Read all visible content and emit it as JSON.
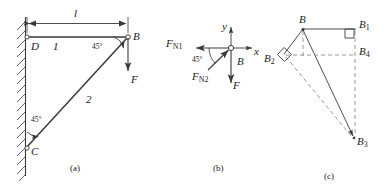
{
  "figure": {
    "type": "engineering-statics-diagram",
    "panels": [
      {
        "id": "a",
        "caption": "(a)",
        "description": "Two-bar bracket attached to a wall: horizontal bar 1 from D to B, inclined bar 2 from C to B, load F applied downward at B",
        "labels": {
          "dimension": "l",
          "node_d": "D",
          "node_c": "C",
          "node_b": "B",
          "bar1": "1",
          "bar2": "2",
          "angle_at_b": "45°",
          "angle_at_c": "45°",
          "load": "F"
        }
      },
      {
        "id": "b",
        "caption": "(b)",
        "description": "Free-body diagram of joint B with x-y axes, bar forces F_N1 and F_N2 and applied load F",
        "labels": {
          "axis_x": "x",
          "axis_y": "y",
          "node_b": "B",
          "force_n1": "F",
          "force_n1_sub": "N1",
          "force_n2": "F",
          "force_n2_sub": "N2",
          "angle": "45°",
          "load": "F"
        }
      },
      {
        "id": "c",
        "caption": "(c)",
        "description": "Displacement (Williot) diagram at joint B with points B1, B2, B3, B4 and two right-angle markers",
        "labels": {
          "node_b": "B",
          "node_b1": "B",
          "node_b1_sub": "1",
          "node_b2": "B",
          "node_b2_sub": "2",
          "node_b3": "B",
          "node_b3_sub": "3",
          "node_b4": "B",
          "node_b4_sub": "4"
        }
      }
    ]
  },
  "style": {
    "line_color": "#3a3a3a",
    "text_color": "#1a1a1a",
    "dash_color": "#8c8c8c",
    "background": "#ffffff"
  }
}
